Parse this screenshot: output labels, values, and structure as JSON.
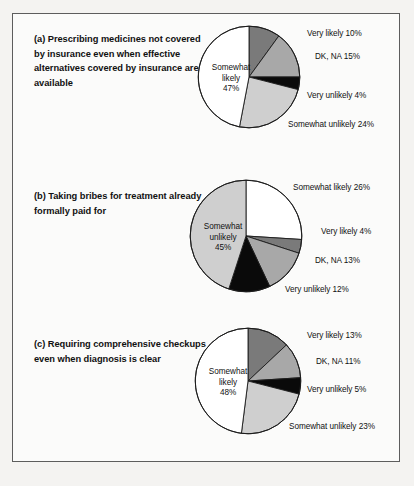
{
  "figure": {
    "background_color": "#fbfbfa",
    "border_color": "#5d5d5d",
    "page_color": "#f4f3f1"
  },
  "palette": {
    "very_likely": "#7a7a7a",
    "dk_na": "#a8a8a8",
    "very_unlikely": "#0a0a0a",
    "somewhat_unlikely": "#cfcfcf",
    "somewhat_likely": "#ffffff",
    "outline": "#1c1c1c"
  },
  "panels": [
    {
      "id": "a",
      "caption": "(a)  Prescribing medicines not covered by insurance even when effective alternatives covered by insurance are available",
      "labels": {
        "very_likely": "Very likely 10%",
        "dk_na": "DK, NA 15%",
        "very_unlikely": "Very unlikely 4%",
        "somewhat_unlikely": "Somewhat unlikely 24%",
        "somewhat_likely_line1": "Somewhat",
        "somewhat_likely_line2": "likely",
        "somewhat_likely_line3": "47%"
      }
    },
    {
      "id": "b",
      "caption": "(b)  Taking bribes for treatment already formally paid for",
      "labels": {
        "somewhat_likely": "Somewhat likely 26%",
        "very_likely": "Very likely 4%",
        "dk_na": "DK, NA 13%",
        "very_unlikely": "Very unlikely 12%",
        "somewhat_unlikely_line1": "Somewhat",
        "somewhat_unlikely_line2": "unlikely",
        "somewhat_unlikely_line3": "45%"
      }
    },
    {
      "id": "c",
      "caption": "(c) Requiring comprehensive checkups even when diagnosis is clear",
      "labels": {
        "very_likely": "Very likely 13%",
        "dk_na": "DK, NA 11%",
        "very_unlikely": "Very unlikely 5%",
        "somewhat_unlikely": "Somewhat unlikely 23%",
        "somewhat_likely_line1": "Somewhat",
        "somewhat_likely_line2": "likely",
        "somewhat_likely_line3": "48%"
      }
    }
  ],
  "chart_data": [
    {
      "type": "pie",
      "title": "(a)  Prescribing medicines not covered by insurance even when effective alternatives covered by insurance are available",
      "labels": [
        "Very likely",
        "DK, NA",
        "Very unlikely",
        "Somewhat unlikely",
        "Somewhat likely"
      ],
      "values": [
        10,
        15,
        4,
        24,
        47
      ],
      "units": "percent",
      "colors": [
        "#7a7a7a",
        "#a8a8a8",
        "#0a0a0a",
        "#cfcfcf",
        "#ffffff"
      ],
      "start_angle_clock": 12,
      "direction": "clockwise",
      "legend": "none"
    },
    {
      "type": "pie",
      "title": "(b)  Taking bribes for treatment already formally paid for",
      "labels": [
        "Somewhat likely",
        "Very likely",
        "DK, NA",
        "Very unlikely",
        "Somewhat unlikely"
      ],
      "values": [
        26,
        4,
        13,
        12,
        45
      ],
      "units": "percent",
      "colors": [
        "#ffffff",
        "#7a7a7a",
        "#a8a8a8",
        "#0a0a0a",
        "#cfcfcf"
      ],
      "start_angle_clock": 12,
      "direction": "clockwise",
      "legend": "none"
    },
    {
      "type": "pie",
      "title": "(c) Requiring comprehensive checkups even when diagnosis is clear",
      "labels": [
        "Very likely",
        "DK, NA",
        "Very unlikely",
        "Somewhat unlikely",
        "Somewhat likely"
      ],
      "values": [
        13,
        11,
        5,
        23,
        48
      ],
      "units": "percent",
      "colors": [
        "#7a7a7a",
        "#a8a8a8",
        "#0a0a0a",
        "#cfcfcf",
        "#ffffff"
      ],
      "start_angle_clock": 12,
      "direction": "clockwise",
      "legend": "none"
    }
  ]
}
